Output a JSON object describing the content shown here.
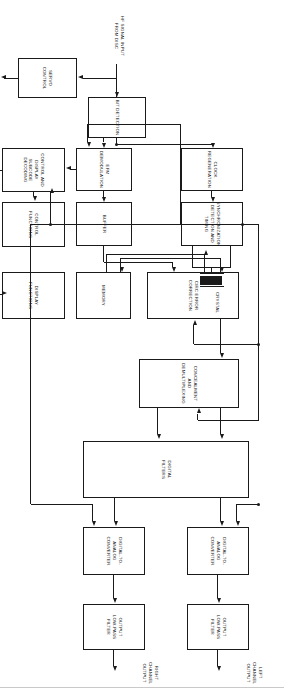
{
  "diagram": {
    "type": "block-diagram",
    "orientation": "rotated-90-clockwise",
    "line_color": "#1a1a1a",
    "background_color": "#ffffff",
    "blocks": [
      {
        "id": "output-lpf-left",
        "label": "OUTPUT\nLOW-PASS\nFILTER"
      },
      {
        "id": "output-lpf-right",
        "label": "OUTPUT\nLOW-PASS\nFILTER"
      },
      {
        "id": "dac-left",
        "label": "DIGITAL-TO-\nANALOG\nCONVERTER"
      },
      {
        "id": "dac-right",
        "label": "DIGITAL-TO-\nANALOG\nCONVERTER"
      },
      {
        "id": "digital-filters",
        "label": "DIGITAL\nFILTERS"
      },
      {
        "id": "concealment",
        "label": "CONCEALMENT\nAND\nDEMULTIPLEXING"
      },
      {
        "id": "circ-error",
        "label": "CIRC ERROR\nCORRECTION"
      },
      {
        "id": "memory",
        "label": "MEMORY"
      },
      {
        "id": "display-functions",
        "label": "DISPLAY\nFUNCTIONS"
      },
      {
        "id": "control-functions",
        "label": "CONTROL\nFUNCTIONS"
      },
      {
        "id": "control-subcode",
        "label": "CONTROL AND\nDISPLAY SUBCODE\nDECODING"
      },
      {
        "id": "buffer",
        "label": "BUFFER"
      },
      {
        "id": "sync-timing",
        "label": "SYNCHRONIZATION\nDETECTION AND\nTIMING"
      },
      {
        "id": "efm-demod",
        "label": "EFM\nDEMODULATION"
      },
      {
        "id": "clock-regen",
        "label": "CLOCK\nREGENERATION"
      },
      {
        "id": "bit-detection",
        "label": "BIT DETECTION"
      },
      {
        "id": "servo-control",
        "label": "SERVO\nCONTROL"
      }
    ],
    "external_labels": [
      {
        "id": "left-channel-output",
        "label": "LEFT\nCHANNEL\nOUTPUT"
      },
      {
        "id": "right-channel-output",
        "label": "RIGHT\nCHANNEL\nOUTPUT"
      },
      {
        "id": "crystal",
        "label": "CRYSTAL"
      },
      {
        "id": "hf-signal-input",
        "label": "HF SIGNAL INPUT\nFROM DISC"
      },
      {
        "id": "disc-pickup",
        "label": "DISC PICKUP\nAND TRANSPORT"
      }
    ]
  }
}
